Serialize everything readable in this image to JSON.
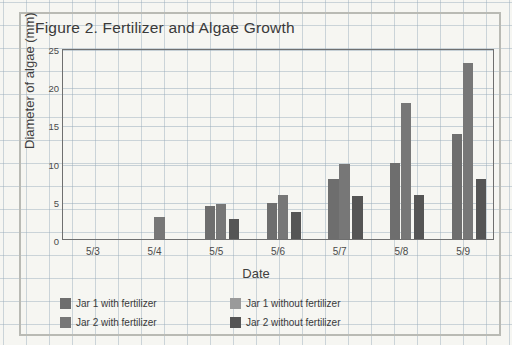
{
  "figure": {
    "title": "Figure 2. Fertilizer and Algae Growth",
    "frame_color": "#b9bab4",
    "background": "#f6f6f2",
    "grid_line_color": "#96aab9"
  },
  "chart_data": {
    "type": "bar",
    "title": "Figure 2. Fertilizer and Algae Growth",
    "xlabel": "Date",
    "ylabel": "Diameter of algae (mm)",
    "categories": [
      "5/3",
      "5/4",
      "5/5",
      "5/6",
      "5/7",
      "5/8",
      "5/9"
    ],
    "ylim": [
      0,
      25
    ],
    "yticks": [
      0,
      5,
      10,
      15,
      20,
      25
    ],
    "grid": true,
    "legend_position": "bottom",
    "series": [
      {
        "name": "Jar 1 with fertilizer",
        "color": "#6e6e6e",
        "values": [
          0,
          0,
          4.3,
          4.7,
          7.9,
          9.9,
          13.8
        ]
      },
      {
        "name": "Jar 2 with fertilizer",
        "color": "#777777",
        "values": [
          0,
          2.9,
          4.6,
          5.8,
          9.8,
          17.8,
          23.0
        ]
      },
      {
        "name": "Jar 1 without fertilizer",
        "color": "#9a9a9a",
        "values": [
          0,
          0,
          0,
          0,
          0,
          0,
          0
        ]
      },
      {
        "name": "Jar 2 without fertilizer",
        "color": "#555555",
        "values": [
          0,
          0,
          2.6,
          3.6,
          5.6,
          5.7,
          7.9
        ]
      }
    ]
  },
  "legend": {
    "entries": [
      {
        "label": "Jar 1 with fertilizer",
        "color": "#6e6e6e"
      },
      {
        "label": "Jar 1 without fertilizer",
        "color": "#9a9a9a"
      },
      {
        "label": "Jar 2 with fertilizer",
        "color": "#777777"
      },
      {
        "label": "Jar 2 without fertilizer",
        "color": "#555555"
      }
    ]
  }
}
